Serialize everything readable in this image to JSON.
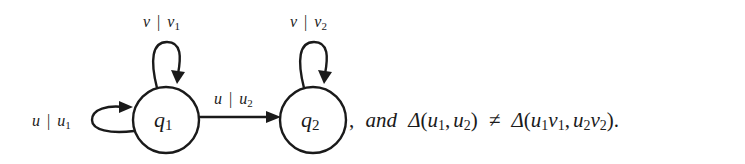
{
  "diagram": {
    "type": "finite-state-transducer",
    "nodes": [
      {
        "id": "q1",
        "label_main": "q",
        "label_sub": "1",
        "cx": 166,
        "cy": 120,
        "r": 33
      },
      {
        "id": "q2",
        "label_main": "q",
        "label_sub": "2",
        "cx": 313,
        "cy": 120,
        "r": 33
      }
    ],
    "edges": [
      {
        "from": "q1",
        "to": "q1",
        "position": "top",
        "label": {
          "input": "v",
          "sep": "|",
          "output_main": "v",
          "output_sub": "1"
        }
      },
      {
        "from": "q1",
        "to": "q1",
        "position": "left",
        "label": {
          "input": "u",
          "sep": "|",
          "output_main": "u",
          "output_sub": "1"
        }
      },
      {
        "from": "q1",
        "to": "q2",
        "position": "straight",
        "label": {
          "input": "u",
          "sep": "|",
          "output_main": "u",
          "output_sub": "2"
        }
      },
      {
        "from": "q2",
        "to": "q2",
        "position": "top",
        "label": {
          "input": "v",
          "sep": "|",
          "output_main": "v",
          "output_sub": "2"
        }
      }
    ]
  },
  "caption": {
    "comma": ",",
    "and": "and",
    "delta": "Δ",
    "lparen": "(",
    "rparen": ")",
    "neq": "≠",
    "period": ".",
    "lhs": {
      "a_main": "u",
      "a_sub": "1",
      "sep": ",",
      "b_main": "u",
      "b_sub": "2"
    },
    "rhs": {
      "a1_main": "u",
      "a1_sub": "1",
      "a2_main": "v",
      "a2_sub": "1",
      "sep": ",",
      "b1_main": "u",
      "b1_sub": "2",
      "b2_main": "v",
      "b2_sub": "2"
    }
  }
}
